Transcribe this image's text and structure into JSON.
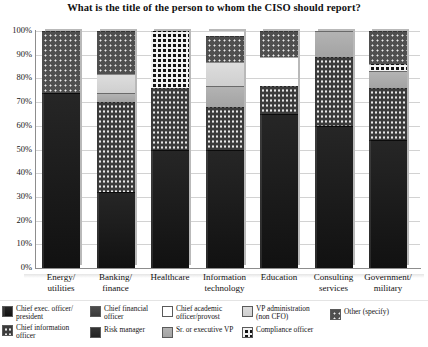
{
  "chart_data": {
    "type": "bar",
    "subtype": "stacked-percentage-column",
    "title": "What is the title of the person to whom the CISO should report?",
    "xlabel": "",
    "ylabel": "",
    "ylim": [
      0,
      100
    ],
    "ytick_labels": [
      "0%",
      "10%",
      "20%",
      "30%",
      "40%",
      "50%",
      "60%",
      "70%",
      "80%",
      "90%",
      "100%"
    ],
    "ytick_values": [
      0,
      10,
      20,
      30,
      40,
      50,
      60,
      70,
      80,
      90,
      100
    ],
    "grid": true,
    "legend_position": "bottom",
    "categories": [
      "Energy/ utilities",
      "Banking/ finance",
      "Healthcare",
      "Information technology",
      "Education",
      "Consulting services",
      "Government/ military"
    ],
    "series": [
      {
        "name": "Chief exec. officer/ president",
        "key": "ceo",
        "pattern": "solid-dark",
        "values": [
          74,
          32,
          50,
          50,
          65,
          60,
          54
        ]
      },
      {
        "name": "Chief information officer",
        "key": "cio",
        "pattern": "fine-dots",
        "values": [
          0,
          38,
          26,
          18,
          12,
          29,
          22
        ]
      },
      {
        "name": "Chief financial officer",
        "key": "cfo",
        "pattern": "solid-medium-gray",
        "values": [
          0,
          0,
          0,
          0,
          0,
          0,
          0
        ]
      },
      {
        "name": "Risk manager",
        "key": "risk",
        "pattern": "solid-charcoal",
        "values": [
          0,
          0,
          0,
          0,
          0,
          0,
          0
        ]
      },
      {
        "name": "Chief academic officer/provost",
        "key": "academic",
        "pattern": "sparse-dots",
        "values": [
          0,
          0,
          0,
          0,
          12,
          0,
          0
        ]
      },
      {
        "name": "Sr. or executive VP",
        "key": "srvp",
        "pattern": "solid-light-gray",
        "values": [
          0,
          4,
          0,
          9,
          0,
          11,
          7
        ]
      },
      {
        "name": "VP administration (non CFO)",
        "key": "vpadmin",
        "pattern": "solid-very-light",
        "values": [
          0,
          8,
          0,
          10,
          0,
          0,
          0
        ]
      },
      {
        "name": "Compliance officer",
        "key": "compliance",
        "pattern": "bold-checker",
        "values": [
          0,
          0,
          24,
          0,
          0,
          0,
          3
        ]
      },
      {
        "name": "Other (specify)",
        "key": "other",
        "pattern": "medium-dots",
        "values": [
          26,
          18,
          0,
          11,
          11,
          0,
          14
        ]
      }
    ]
  },
  "legend": {
    "items": [
      {
        "label": "Chief exec. officer/\npresident",
        "key": "ceo"
      },
      {
        "label": "Chief information\nofficer",
        "key": "cio"
      },
      {
        "label": "Chief financial\nofficer",
        "key": "cfo"
      },
      {
        "label": "Risk manager",
        "key": "risk"
      },
      {
        "label": "Chief academic\nofficer/provost",
        "key": "academic"
      },
      {
        "label": "Sr. or executive VP",
        "key": "srvp"
      },
      {
        "label": "VP administration\n(non CFO)",
        "key": "vpadmin"
      },
      {
        "label": "Compliance officer",
        "key": "compliance"
      },
      {
        "label": "Other (specify)",
        "key": "other"
      }
    ]
  }
}
